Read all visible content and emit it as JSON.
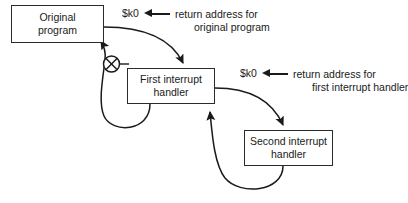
{
  "diagram": {
    "background_color": "#ffffff",
    "stroke_color": "#2b2b2b",
    "text_color": "#1a1a1a",
    "nodes": [
      {
        "id": "original",
        "label": "Original\nprogram",
        "line1": "Original",
        "line2": "program"
      },
      {
        "id": "first",
        "label": "First interrupt\nhandler",
        "line1": "First interrupt",
        "line2": "handler"
      },
      {
        "id": "second",
        "label": "Second interrupt\nhandler",
        "line1": "Second interrupt",
        "line2": "handler"
      }
    ],
    "junction": {
      "id": "exclusive-or-junction",
      "symbol": "crossed-circle"
    },
    "annotations": [
      {
        "id": "annotation-original",
        "register": "$k0",
        "arrow": "left-arrow",
        "text_line1": "return address for",
        "text_line2": "original program"
      },
      {
        "id": "annotation-first",
        "register": "$k0",
        "arrow": "left-arrow",
        "text_line1": "return address for",
        "text_line2": "first interrupt handler"
      }
    ],
    "edges": [
      {
        "id": "original-to-first",
        "from": "original",
        "to": "first",
        "kind": "interrupt-transfer",
        "direction": "forward"
      },
      {
        "id": "first-to-original",
        "from": "first",
        "to": "original",
        "kind": "return",
        "direction": "back"
      },
      {
        "id": "first-to-second",
        "from": "first",
        "to": "second",
        "kind": "interrupt-transfer",
        "direction": "forward"
      },
      {
        "id": "second-to-first",
        "from": "second",
        "to": "first",
        "kind": "return",
        "direction": "back"
      }
    ]
  }
}
